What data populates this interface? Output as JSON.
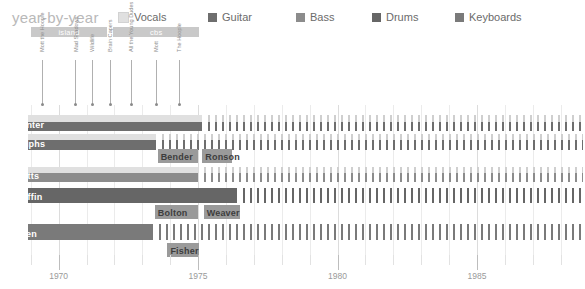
{
  "header": {
    "title": "year-by-year"
  },
  "legend": {
    "items": [
      {
        "label": "Vocals",
        "color": "#e0e0e0",
        "x": 0
      },
      {
        "label": "Guitar",
        "color": "#6e6e6e",
        "x": 90
      },
      {
        "label": "Bass",
        "color": "#8c8c8c",
        "x": 178
      },
      {
        "label": "Drums",
        "color": "#666666",
        "x": 254
      },
      {
        "label": "Keyboards",
        "color": "#7a7a7a",
        "x": 337
      }
    ]
  },
  "eras": [
    {
      "label": "island",
      "start": 1969.0,
      "end": 1971.75
    },
    {
      "label": "cbs",
      "start": 1971.95,
      "end": 1975.05
    }
  ],
  "albums": [
    {
      "label": "Mott the Hoople",
      "year": 1969.4
    },
    {
      "label": "Mad Shadows",
      "year": 1970.6
    },
    {
      "label": "Wildlife",
      "year": 1971.2
    },
    {
      "label": "Brain Capers",
      "year": 1971.85
    },
    {
      "label": "All the Young Dudes",
      "year": 1972.6
    },
    {
      "label": "Mott",
      "year": 1973.5
    },
    {
      "label": "The Hoople",
      "year": 1974.3
    }
  ],
  "chart_data": {
    "type": "bar",
    "title": "year-by-year",
    "xlabel": "",
    "ylabel": "",
    "xlim": [
      1968.4,
      1988.8
    ],
    "ticks_major": [
      1970,
      1975,
      1980,
      1985
    ],
    "tick_labels": [
      "1970",
      "1975",
      "1980",
      "1985"
    ],
    "grid": true,
    "legend_position": "top",
    "rows": [
      {
        "name": "Hunter",
        "name_inside": true,
        "top": 10,
        "height": 16,
        "segments": [
          {
            "role": "Vocals",
            "color": "#e0e0e0",
            "start": 1968.9,
            "end": 1975.15,
            "top": 0,
            "height": 7,
            "style": "solid"
          },
          {
            "role": "Guitar",
            "color": "#6e6e6e",
            "start": 1968.9,
            "end": 1975.15,
            "top": 7,
            "height": 9,
            "style": "solid"
          },
          {
            "role": "Vocals",
            "color": "#cfcfcf",
            "start": 1975.35,
            "end": 1988.8,
            "top": 0,
            "height": 7,
            "style": "striped"
          },
          {
            "role": "Guitar",
            "color": "#6e6e6e",
            "start": 1975.35,
            "end": 1988.8,
            "top": 7,
            "height": 9,
            "style": "striped"
          }
        ]
      },
      {
        "name": "Ralphs",
        "name_inside": true,
        "top": 29,
        "height": 16,
        "segments": [
          {
            "role": "Vocals",
            "color": "#e0e0e0",
            "start": 1968.9,
            "end": 1973.5,
            "top": 0,
            "height": 6,
            "style": "solid"
          },
          {
            "role": "Guitar",
            "color": "#6e6e6e",
            "start": 1968.9,
            "end": 1973.5,
            "top": 6,
            "height": 10,
            "style": "solid"
          },
          {
            "role": "Vocals",
            "color": "#cfcfcf",
            "start": 1973.7,
            "end": 1988.8,
            "top": 0,
            "height": 6,
            "style": "striped"
          },
          {
            "role": "Guitar",
            "color": "#6e6e6e",
            "start": 1973.7,
            "end": 1988.8,
            "top": 6,
            "height": 10,
            "style": "striped"
          }
        ]
      },
      {
        "name": "Bender",
        "name_inside": false,
        "top": 44,
        "height": 14,
        "segments": [
          {
            "role": "Guitar",
            "color": "#9a9a9a",
            "start": 1973.55,
            "end": 1975.0,
            "top": 0,
            "height": 14,
            "style": "solid"
          }
        ]
      },
      {
        "name": "Ronson",
        "name_inside": false,
        "top": 44,
        "height": 14,
        "segments": [
          {
            "role": "Guitar",
            "color": "#9a9a9a",
            "start": 1975.15,
            "end": 1976.2,
            "top": 0,
            "height": 14,
            "style": "solid"
          }
        ]
      },
      {
        "name": "Watts",
        "name_inside": true,
        "top": 62,
        "height": 15,
        "segments": [
          {
            "role": "Vocals",
            "color": "#e0e0e0",
            "start": 1968.9,
            "end": 1975.0,
            "top": 0,
            "height": 6,
            "style": "solid"
          },
          {
            "role": "Bass",
            "color": "#8c8c8c",
            "start": 1968.9,
            "end": 1975.0,
            "top": 6,
            "height": 9,
            "style": "solid"
          },
          {
            "role": "Vocals",
            "color": "#cfcfcf",
            "start": 1975.2,
            "end": 1988.8,
            "top": 0,
            "height": 6,
            "style": "striped"
          },
          {
            "role": "Bass",
            "color": "#8c8c8c",
            "start": 1975.2,
            "end": 1988.8,
            "top": 6,
            "height": 9,
            "style": "striped"
          }
        ]
      },
      {
        "name": "Griffin",
        "name_inside": true,
        "top": 83,
        "height": 15,
        "segments": [
          {
            "role": "Drums",
            "color": "#666666",
            "start": 1968.9,
            "end": 1976.4,
            "top": 0,
            "height": 15,
            "style": "solid"
          },
          {
            "role": "Drums",
            "color": "#666666",
            "start": 1976.6,
            "end": 1988.8,
            "top": 0,
            "height": 15,
            "style": "striped"
          }
        ]
      },
      {
        "name": "Bolton",
        "name_inside": false,
        "top": 100,
        "height": 14,
        "segments": [
          {
            "role": "Keyboards",
            "color": "#9a9a9a",
            "start": 1973.45,
            "end": 1975.0,
            "top": 0,
            "height": 14,
            "style": "solid"
          }
        ]
      },
      {
        "name": "Weaver",
        "name_inside": false,
        "top": 100,
        "height": 14,
        "segments": [
          {
            "role": "Keyboards",
            "color": "#9a9a9a",
            "start": 1975.2,
            "end": 1976.5,
            "top": 0,
            "height": 14,
            "style": "solid"
          }
        ]
      },
      {
        "name": "Allen",
        "name_inside": true,
        "top": 119,
        "height": 16,
        "segments": [
          {
            "role": "Keyboards",
            "color": "#7a7a7a",
            "start": 1968.9,
            "end": 1973.4,
            "top": 0,
            "height": 16,
            "style": "solid"
          },
          {
            "role": "Keyboards",
            "color": "#7a7a7a",
            "start": 1973.6,
            "end": 1988.8,
            "top": 0,
            "height": 16,
            "style": "striped"
          }
        ]
      },
      {
        "name": "Fisher",
        "name_inside": false,
        "top": 138,
        "height": 14,
        "segments": [
          {
            "role": "Keyboards",
            "color": "#9a9a9a",
            "start": 1973.9,
            "end": 1975.05,
            "top": 0,
            "height": 14,
            "style": "solid"
          }
        ]
      }
    ]
  }
}
